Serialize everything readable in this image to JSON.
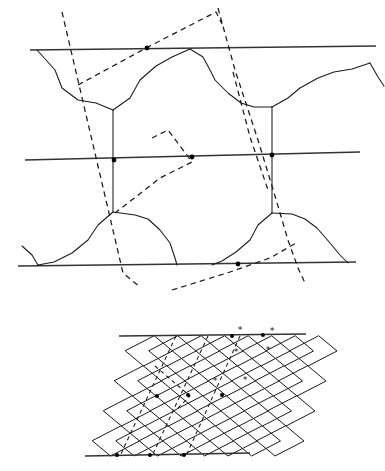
{
  "figure": {
    "panels": [
      {
        "id": "top",
        "name": "grain-boundary-network-panel"
      },
      {
        "id": "bottom",
        "name": "rhombic-lattice-panel"
      }
    ],
    "colors": {
      "background": "#ffffff",
      "solid_stroke": "#1a1a1a",
      "reference_stroke": "#333333",
      "dashed_stroke": "#1a1a1a",
      "marker_fill": "#000000"
    }
  },
  "chart_data": {
    "type": "diagram",
    "xlabel": "",
    "ylabel": "",
    "grid": false,
    "legend": "none",
    "xlim": [
      0,
      385
    ],
    "ylim": [
      0,
      471
    ],
    "top_panel": {
      "name": "grain-boundary-network",
      "reference_lines": [
        {
          "name": "upper-reference-line",
          "points": "30,50 376,46"
        },
        {
          "name": "middle-reference-line",
          "points": "25,160 360,152"
        },
        {
          "name": "lower-reference-line",
          "points": "18,266 356,262"
        }
      ],
      "boundary_paths": [
        "37,50 55,70 62,88 78,100 96,103 113,110",
        "113,110 113,160 113,170 113,212",
        "113,110 130,98 140,80 156,66 172,57 190,49",
        "190,49 203,57 210,70 215,80 228,93 241,103 254,107 272,107",
        "272,107 272,160 272,170 272,213",
        "272,107 288,98 300,88 318,78 334,72 352,69 370,63",
        "370,63 378,77 384,86",
        "113,212 98,225 88,240 72,253 54,262 38,265",
        "113,212 135,215 148,219 160,230 170,243 175,258 177,265",
        "272,213 258,225 250,240 236,252 222,261 212,265",
        "272,213 292,214 305,219 317,228 330,243 340,255 348,263",
        "22,246 32,255 38,265"
      ],
      "dashed_paths": [
        {
          "name": "slip-band-left-trace",
          "points": "62,12 123,273 140,287"
        },
        {
          "name": "slip-band-right-trace",
          "points": "218,8 235,70 258,140 275,196 288,240 298,268 305,283"
        },
        {
          "name": "slip-band-upper-chevron",
          "points": "78,85 148,47 216,12 222,24"
        },
        {
          "name": "slip-band-interior-chevron",
          "points": "152,138 168,130 192,162 160,178 137,196 115,213"
        },
        {
          "name": "slip-band-lower-trace",
          "points": "172,290 230,272 270,258 296,243"
        },
        {
          "name": "slip-band-right-short",
          "points": "233,72 250,137 268,190"
        }
      ],
      "node_markers": [
        {
          "name": "node-top-line",
          "x": 147,
          "y": 48
        },
        {
          "name": "node-middle-left",
          "x": 114,
          "y": 160
        },
        {
          "name": "node-middle-center",
          "x": 192,
          "y": 157
        },
        {
          "name": "node-middle-right",
          "x": 272,
          "y": 155
        },
        {
          "name": "node-bottom-line",
          "x": 238,
          "y": 264
        }
      ]
    },
    "bottom_panel": {
      "name": "rhombic-lattice",
      "reference_lines": [
        {
          "name": "lattice-top-reference-line",
          "points": "119,336 306,334"
        },
        {
          "name": "lattice-bottom-reference-line",
          "points": "85,456 250,453"
        }
      ],
      "lattice_rows": 4,
      "lattice_columns": 4,
      "row_shift_x": -11,
      "cell_width": 47,
      "cell_height": 30,
      "origin": {
        "x": 131,
        "y": 336
      },
      "node_markers": [
        {
          "name": "lattice-node-top-a",
          "x": 232,
          "y": 336
        },
        {
          "name": "lattice-node-top-b",
          "x": 263,
          "y": 335
        },
        {
          "name": "lattice-node-mid-a",
          "x": 157,
          "y": 396
        },
        {
          "name": "lattice-node-mid-b",
          "x": 188,
          "y": 395
        },
        {
          "name": "lattice-node-mid-c",
          "x": 222,
          "y": 395
        },
        {
          "name": "lattice-node-bottom-a",
          "x": 117,
          "y": 455
        },
        {
          "name": "lattice-node-bottom-b",
          "x": 150,
          "y": 455
        },
        {
          "name": "lattice-node-bottom-c",
          "x": 184,
          "y": 455
        }
      ],
      "dashed_paths": [
        {
          "name": "lattice-trace-left",
          "points": "176,336 120,456"
        },
        {
          "name": "lattice-trace-mid",
          "points": "208,336 152,456"
        },
        {
          "name": "lattice-trace-right",
          "points": "240,336 186,456"
        },
        {
          "name": "lattice-chevron",
          "points": "155,366 190,396 176,410"
        }
      ],
      "asterisks": [
        {
          "name": "asterisk-1",
          "x": 240,
          "y": 330,
          "glyph": "*"
        },
        {
          "name": "asterisk-2",
          "x": 272,
          "y": 331,
          "glyph": "*"
        },
        {
          "name": "asterisk-3",
          "x": 236,
          "y": 352,
          "glyph": "*"
        },
        {
          "name": "asterisk-4",
          "x": 268,
          "y": 350,
          "glyph": "*"
        },
        {
          "name": "asterisk-5",
          "x": 215,
          "y": 381,
          "glyph": "*"
        },
        {
          "name": "asterisk-6",
          "x": 245,
          "y": 380,
          "glyph": "*"
        }
      ]
    }
  }
}
